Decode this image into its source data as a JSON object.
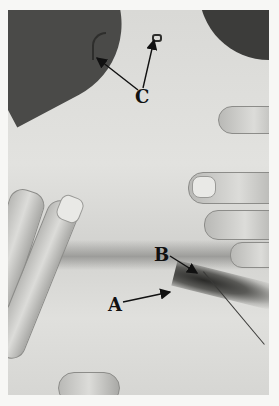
{
  "figure": {
    "labels": {
      "a": "A",
      "b": "B",
      "c": "C"
    },
    "annotations": [
      {
        "label": "A",
        "target": "dark sinus/lesion area in skin fold",
        "arrows": 1
      },
      {
        "label": "B",
        "target": "probe insertion point at hair-bearing lesion",
        "arrows": 1
      },
      {
        "label": "C",
        "target": "two small incision marks at top of image",
        "arrows": 2
      }
    ],
    "colors": {
      "background": "#f7f7f5",
      "skin": "#dcdcd9",
      "shadow": "#4a4a48",
      "ink": "#111111"
    }
  }
}
